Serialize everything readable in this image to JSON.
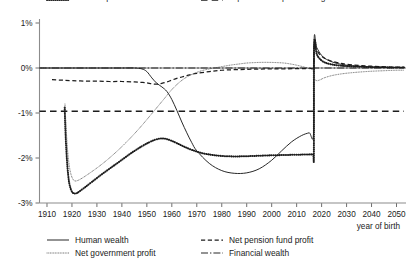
{
  "chart_data": {
    "type": "line",
    "title": "",
    "xlabel": "year of birth",
    "ylabel": "",
    "xlim": [
      1907,
      2053
    ],
    "ylim": [
      -3,
      1
    ],
    "grid": false,
    "legend_position": "bottom",
    "x_ticks": [
      1910,
      1920,
      1930,
      1940,
      1950,
      1960,
      1970,
      1980,
      1990,
      2000,
      2010,
      2020,
      2030,
      2040,
      2050
    ],
    "x_tick_labels": [
      "1910",
      "1920",
      "1930",
      "1940",
      "1950",
      "1960",
      "1970",
      "1980",
      "1990",
      "2000",
      "2010",
      "2020",
      "2030",
      "2040",
      "2050"
    ],
    "y_ticks": [
      1,
      0,
      -1,
      -2,
      -3
    ],
    "y_tick_labels": [
      "1%",
      "0%",
      "-1%",
      "-2%",
      "-3%"
    ],
    "series": [
      {
        "name": "Human wealth",
        "style": "solid",
        "x": [
          1907,
          1910,
          1914,
          1917,
          1917.4,
          1920,
          1930,
          1940,
          1945,
          1948,
          1950,
          1952,
          1954,
          1956,
          1958,
          1960,
          1962,
          1964,
          1966,
          1968,
          1970,
          1975,
          1980,
          1985,
          1990,
          1995,
          2000,
          2004,
          2008,
          2012,
          2015,
          2016.8,
          2017,
          2018,
          2020,
          2022,
          2025,
          2028,
          2032,
          2036,
          2040,
          2045,
          2050,
          2053
        ],
        "values": [
          0,
          0,
          0,
          0,
          0,
          0,
          0,
          0,
          0,
          -0.02,
          -0.08,
          -0.22,
          -0.34,
          -0.42,
          -0.52,
          -0.7,
          -0.94,
          -1.2,
          -1.44,
          -1.66,
          -1.84,
          -2.12,
          -2.28,
          -2.34,
          -2.33,
          -2.24,
          -2.05,
          -1.84,
          -1.64,
          -1.5,
          -1.44,
          -1.43,
          0.63,
          0.46,
          0.28,
          0.19,
          0.12,
          0.08,
          0.05,
          0.035,
          0.025,
          0.015,
          0.01,
          0.01
        ]
      },
      {
        "name": "Financial wealth",
        "style": "dash-dot",
        "x": [
          1907,
          1912,
          1916,
          1917,
          1917.2,
          1919,
          1921,
          1925,
          1930,
          1940,
          1950,
          1960,
          1970,
          1980,
          1990,
          2000,
          2010,
          2017,
          2020,
          2030,
          2040,
          2050,
          2053
        ],
        "values": [
          0,
          0,
          0,
          0,
          0,
          0,
          0,
          0,
          0,
          0,
          0,
          0,
          0,
          0,
          0,
          0,
          0,
          0,
          0,
          0,
          0,
          0,
          0
        ]
      },
      {
        "name": "Net pension fund profit",
        "style": "dashed",
        "x": [
          1912,
          1916,
          1920,
          1925,
          1930,
          1935,
          1940,
          1945,
          1948,
          1950,
          1952,
          1954,
          1956,
          1958,
          1960,
          1962,
          1964,
          1966,
          1968,
          1970,
          1975,
          1980,
          1990,
          2000,
          2010,
          2016,
          2016.9,
          2017,
          2018,
          2020,
          2023,
          2027,
          2032,
          2038,
          2044,
          2050,
          2053
        ],
        "values": [
          -0.26,
          -0.27,
          -0.28,
          -0.29,
          -0.29,
          -0.3,
          -0.3,
          -0.31,
          -0.32,
          -0.33,
          -0.35,
          -0.36,
          -0.34,
          -0.31,
          -0.27,
          -0.23,
          -0.2,
          -0.17,
          -0.14,
          -0.12,
          -0.08,
          -0.05,
          -0.03,
          -0.02,
          -0.015,
          -0.01,
          -0.01,
          0.52,
          0.4,
          0.26,
          0.17,
          0.11,
          0.07,
          0.045,
          0.03,
          0.02,
          0.02
        ]
      },
      {
        "name": "Consumption",
        "style": "dotted-thick",
        "x": [
          1917.1,
          1917.3,
          1917.6,
          1918,
          1918.5,
          1919,
          1919.6,
          1920.3,
          1921,
          1922,
          1923,
          1925,
          1928,
          1932,
          1936,
          1940,
          1944,
          1948,
          1951,
          1953,
          1955,
          1956,
          1957,
          1958,
          1960,
          1962,
          1965,
          1968,
          1972,
          1976,
          1980,
          1985,
          1990,
          1995,
          2000,
          2004,
          2008,
          2012,
          2015,
          2016.6,
          2016.9,
          2017,
          2018,
          2019,
          2021,
          2024,
          2028,
          2033,
          2039,
          2045,
          2050,
          2053
        ],
        "values": [
          -0.88,
          -1.25,
          -1.65,
          -2.05,
          -2.38,
          -2.58,
          -2.7,
          -2.77,
          -2.79,
          -2.78,
          -2.74,
          -2.66,
          -2.53,
          -2.36,
          -2.2,
          -2.04,
          -1.88,
          -1.74,
          -1.65,
          -1.6,
          -1.57,
          -1.565,
          -1.57,
          -1.58,
          -1.62,
          -1.67,
          -1.75,
          -1.82,
          -1.89,
          -1.93,
          -1.955,
          -1.965,
          -1.96,
          -1.95,
          -1.94,
          -1.935,
          -1.93,
          -1.925,
          -1.92,
          -1.92,
          -1.92,
          0.5,
          0.32,
          0.22,
          0.13,
          0.08,
          0.05,
          0.035,
          0.02,
          0.015,
          0.01,
          0.01
        ]
      },
      {
        "name": "Net government profit",
        "style": "dotted-fine",
        "x": [
          1917.2,
          1917.5,
          1917.9,
          1918.4,
          1919,
          1919.7,
          1920.5,
          1921.3,
          1922.3,
          1924,
          1927,
          1931,
          1935,
          1939,
          1943,
          1947,
          1951,
          1954,
          1957,
          1960,
          1963,
          1966,
          1969,
          1972,
          1975,
          1979,
          1983,
          1987,
          1990,
          1993,
          1996,
          1999,
          2002,
          2005,
          2008,
          2011,
          2014,
          2016.5,
          2016.9,
          2017,
          2018,
          2019.5,
          2021,
          2024,
          2028,
          2033,
          2039,
          2045,
          2050,
          2053
        ],
        "values": [
          -0.8,
          -1.15,
          -1.55,
          -1.92,
          -2.2,
          -2.38,
          -2.48,
          -2.51,
          -2.5,
          -2.45,
          -2.34,
          -2.18,
          -2.0,
          -1.8,
          -1.58,
          -1.34,
          -1.08,
          -0.88,
          -0.68,
          -0.48,
          -0.32,
          -0.2,
          -0.12,
          -0.06,
          -0.02,
          0.02,
          0.06,
          0.09,
          0.11,
          0.12,
          0.125,
          0.125,
          0.12,
          0.11,
          0.085,
          0.05,
          0.005,
          -0.04,
          -0.05,
          -0.22,
          -0.28,
          -0.26,
          -0.22,
          -0.17,
          -0.13,
          -0.1,
          -0.075,
          -0.06,
          -0.05,
          -0.05
        ]
      },
      {
        "name": "Equal consumption change",
        "style": "long-dashed",
        "x": [
          1907,
          1920,
          1940,
          1960,
          1980,
          2000,
          2020,
          2040,
          2053
        ],
        "values": [
          -0.96,
          -0.96,
          -0.96,
          -0.96,
          -0.96,
          -0.96,
          -0.96,
          -0.96,
          -0.96
        ]
      }
    ]
  },
  "legend": {
    "entries": [
      {
        "label": "Human wealth",
        "style": "solid"
      },
      {
        "label": "Net pension fund profit",
        "style": "dashed"
      },
      {
        "label": "Net government profit",
        "style": "dotted-fine"
      },
      {
        "label": "Financial wealth",
        "style": "dash-dot"
      },
      {
        "label": "Consumption",
        "style": "dotted-thick"
      },
      {
        "label": "Equal consumption change",
        "style": "long-dashed"
      }
    ]
  }
}
